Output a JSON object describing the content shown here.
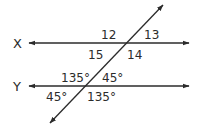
{
  "diagram": {
    "type": "parallel-lines-transversal",
    "stroke_color": "#2b2b2b",
    "lines": {
      "x": {
        "label": "X"
      },
      "y": {
        "label": "Y"
      }
    },
    "angles_at_x": {
      "top_left": "12",
      "top_right": "13",
      "bottom_left": "15",
      "bottom_right": "14"
    },
    "angles_at_y": {
      "top_left": "135°",
      "top_right": "45°",
      "bottom_left": "45°",
      "bottom_right": "135°"
    }
  }
}
